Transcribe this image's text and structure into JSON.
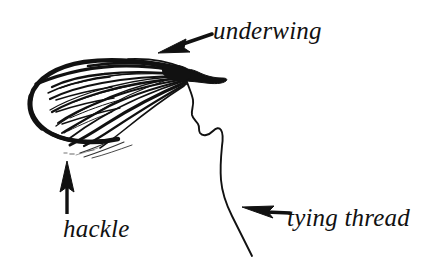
{
  "figure": {
    "background_color": "#ffffff",
    "ink_color": "#111111",
    "width": 425,
    "height": 271
  },
  "labels": {
    "underwing": "underwing",
    "hackle": "hackle",
    "tying_thread": "tying thread"
  },
  "annotations": [
    {
      "name": "underwing",
      "text": "underwing",
      "arrow_from": [
        212,
        34
      ],
      "arrow_to": [
        160,
        53
      ],
      "direction": "down-left"
    },
    {
      "name": "hackle",
      "text": "hackle",
      "arrow_from": [
        67,
        214
      ],
      "arrow_to": [
        67,
        163
      ],
      "direction": "up"
    },
    {
      "name": "tying-thread",
      "text": "tying thread",
      "arrow_from": [
        289,
        214
      ],
      "arrow_to": [
        243,
        209
      ],
      "direction": "left"
    }
  ],
  "drawing": {
    "parts": [
      "wing-outline",
      "wing-hatching",
      "hackle-fibers",
      "head",
      "tying-thread-line"
    ]
  }
}
